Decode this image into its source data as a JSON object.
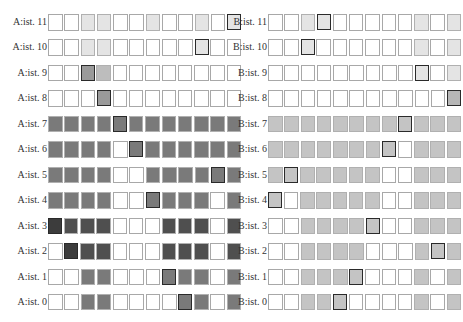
{
  "figure": {
    "type": "cell-state grid diagram",
    "palette": {
      "w": "#ffffff",
      "L": "#e4e4e4",
      "Lm": "#bdbdbd",
      "M": "#9a9a9a",
      "G": "#7a7a7a",
      "D": "#4f4f4f",
      "K": "#3c3c3c",
      "B": "#c4c4c4",
      "Bm": "#b6b6b6"
    },
    "panels": [
      {
        "id": "A",
        "rows": [
          {
            "label": "A:ist. 11",
            "cells": [
              "w",
              "w",
              "L",
              "L",
              "w",
              "w",
              "L",
              "w",
              "w",
              "L",
              "w",
              "L"
            ],
            "bold": 11
          },
          {
            "label": "A:ist. 10",
            "cells": [
              "w",
              "w",
              "L",
              "L",
              "w",
              "w",
              "w",
              "w",
              "w",
              "L",
              "w",
              "w"
            ],
            "bold": 9
          },
          {
            "label": "A:ist. 9",
            "cells": [
              "w",
              "w",
              "M",
              "Lm",
              "w",
              "w",
              "w",
              "w",
              "w",
              "w",
              "w",
              "w"
            ],
            "bold": 2
          },
          {
            "label": "A:ist. 8",
            "cells": [
              "w",
              "w",
              "w",
              "M",
              "w",
              "w",
              "w",
              "w",
              "w",
              "w",
              "w",
              "w"
            ],
            "bold": 3
          },
          {
            "label": "A:ist. 7",
            "cells": [
              "G",
              "G",
              "G",
              "G",
              "G",
              "G",
              "G",
              "G",
              "G",
              "G",
              "G",
              "G"
            ],
            "bold": 4
          },
          {
            "label": "A:ist. 6",
            "cells": [
              "G",
              "G",
              "G",
              "G",
              "w",
              "G",
              "G",
              "G",
              "G",
              "G",
              "G",
              "G"
            ],
            "bold": 5
          },
          {
            "label": "A:ist. 5",
            "cells": [
              "G",
              "G",
              "G",
              "G",
              "w",
              "w",
              "G",
              "G",
              "G",
              "G",
              "G",
              "G"
            ],
            "bold": 10
          },
          {
            "label": "A:ist. 4",
            "cells": [
              "G",
              "G",
              "G",
              "G",
              "w",
              "w",
              "G",
              "G",
              "G",
              "G",
              "w",
              "G"
            ],
            "bold": 6
          },
          {
            "label": "A:ist. 3",
            "cells": [
              "K",
              "D",
              "D",
              "D",
              "w",
              "w",
              "w",
              "D",
              "D",
              "D",
              "w",
              "D"
            ],
            "bold": 0
          },
          {
            "label": "A:ist. 2",
            "cells": [
              "w",
              "K",
              "D",
              "D",
              "w",
              "w",
              "w",
              "D",
              "D",
              "D",
              "w",
              "D"
            ],
            "bold": 1
          },
          {
            "label": "A:ist. 1",
            "cells": [
              "w",
              "w",
              "G",
              "G",
              "w",
              "w",
              "w",
              "G",
              "G",
              "G",
              "w",
              "G"
            ],
            "bold": 7
          },
          {
            "label": "A:ist. 0",
            "cells": [
              "w",
              "w",
              "G",
              "G",
              "w",
              "w",
              "w",
              "w",
              "G",
              "G",
              "w",
              "G"
            ],
            "bold": 8
          }
        ]
      },
      {
        "id": "B",
        "rows": [
          {
            "label": "B:ist. 11",
            "cells": [
              "w",
              "w",
              "L",
              "L",
              "w",
              "w",
              "w",
              "w",
              "w",
              "L",
              "w",
              "L"
            ],
            "bold": 3
          },
          {
            "label": "B:ist. 10",
            "cells": [
              "w",
              "w",
              "L",
              "w",
              "w",
              "w",
              "w",
              "w",
              "w",
              "L",
              "w",
              "L"
            ],
            "bold": 2
          },
          {
            "label": "B:ist. 9",
            "cells": [
              "w",
              "w",
              "w",
              "w",
              "w",
              "w",
              "w",
              "w",
              "w",
              "L",
              "w",
              "L"
            ],
            "bold": 9
          },
          {
            "label": "B:ist. 8",
            "cells": [
              "w",
              "w",
              "w",
              "w",
              "w",
              "w",
              "w",
              "w",
              "w",
              "w",
              "w",
              "Bm"
            ],
            "bold": 11
          },
          {
            "label": "B:ist. 7",
            "cells": [
              "B",
              "B",
              "B",
              "B",
              "B",
              "B",
              "B",
              "B",
              "B",
              "B",
              "B",
              "B"
            ],
            "bold": 8
          },
          {
            "label": "B:ist. 6",
            "cells": [
              "B",
              "B",
              "B",
              "B",
              "B",
              "B",
              "B",
              "B",
              "w",
              "B",
              "B",
              "B"
            ],
            "bold": 7
          },
          {
            "label": "B:ist. 5",
            "cells": [
              "B",
              "B",
              "B",
              "B",
              "B",
              "B",
              "B",
              "w",
              "w",
              "B",
              "B",
              "B"
            ],
            "bold": 1
          },
          {
            "label": "B:ist. 4",
            "cells": [
              "B",
              "w",
              "B",
              "B",
              "B",
              "B",
              "B",
              "w",
              "w",
              "B",
              "B",
              "B"
            ],
            "bold": 0
          },
          {
            "label": "B:ist. 3",
            "cells": [
              "w",
              "w",
              "B",
              "B",
              "B",
              "B",
              "B",
              "w",
              "w",
              "B",
              "B",
              "B"
            ],
            "bold": 6
          },
          {
            "label": "B:ist. 2",
            "cells": [
              "w",
              "w",
              "B",
              "B",
              "B",
              "B",
              "w",
              "w",
              "w",
              "B",
              "B",
              "B"
            ],
            "bold": 10
          },
          {
            "label": "B:ist. 1",
            "cells": [
              "w",
              "w",
              "B",
              "B",
              "B",
              "B",
              "w",
              "w",
              "w",
              "B",
              "w",
              "B"
            ],
            "bold": 5
          },
          {
            "label": "B:ist. 0",
            "cells": [
              "w",
              "w",
              "B",
              "B",
              "B",
              "w",
              "w",
              "w",
              "w",
              "B",
              "w",
              "B"
            ],
            "bold": 4
          }
        ]
      }
    ]
  }
}
